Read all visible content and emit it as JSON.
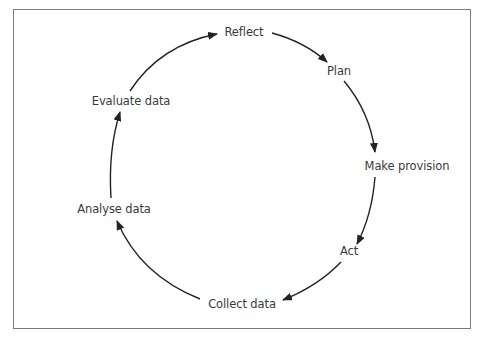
{
  "diagram": {
    "type": "cycle",
    "direction": "clockwise",
    "stroke_color": "#222222",
    "frame_color": "#7a7a7a",
    "text_color": "#3a3a3a",
    "nodes": [
      {
        "id": "reflect",
        "label": "Reflect",
        "x": 244,
        "y": 32
      },
      {
        "id": "plan",
        "label": "Plan",
        "x": 339,
        "y": 71
      },
      {
        "id": "make-provision",
        "label": "Make provision",
        "x": 407,
        "y": 166
      },
      {
        "id": "act",
        "label": "Act",
        "x": 349,
        "y": 251
      },
      {
        "id": "collect-data",
        "label": "Collect data",
        "x": 242,
        "y": 304
      },
      {
        "id": "analyse-data",
        "label": "Analyse data",
        "x": 114,
        "y": 209
      },
      {
        "id": "evaluate-data",
        "label": "Evaluate data",
        "x": 131,
        "y": 101
      }
    ],
    "edges": [
      {
        "from": "reflect",
        "to": "plan"
      },
      {
        "from": "plan",
        "to": "make-provision"
      },
      {
        "from": "make-provision",
        "to": "act"
      },
      {
        "from": "act",
        "to": "collect-data"
      },
      {
        "from": "collect-data",
        "to": "analyse-data"
      },
      {
        "from": "analyse-data",
        "to": "evaluate-data"
      },
      {
        "from": "evaluate-data",
        "to": "reflect"
      }
    ]
  }
}
